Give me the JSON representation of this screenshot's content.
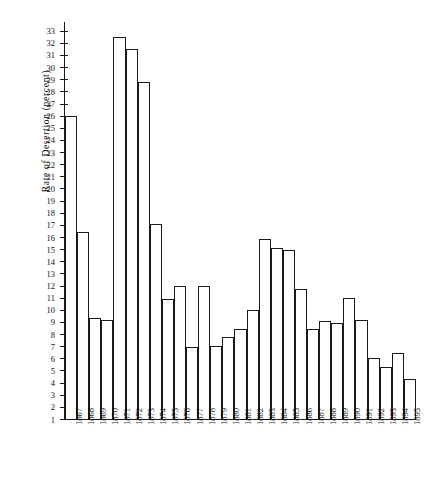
{
  "chart_data": {
    "type": "bar",
    "title": "",
    "xlabel": "",
    "ylabel": "Rate  of  Desertion  (percent)",
    "ylim": [
      1,
      33.8
    ],
    "baseline": 1,
    "grid": false,
    "legend": null,
    "ytick_labels": [
      "1",
      "2",
      "3",
      "4",
      "5",
      "6",
      "7",
      "8",
      "9",
      "10",
      "11",
      "12",
      "13",
      "14",
      "15",
      "16",
      "17",
      "18",
      "19",
      "20",
      "21",
      "22",
      "23",
      "24",
      "25",
      "26",
      "27",
      "28",
      "29",
      "30",
      "31",
      "32",
      "33"
    ],
    "categories": [
      "1867",
      "1868",
      "1869",
      "1870",
      "1871",
      "1872",
      "1873",
      "1874",
      "1875",
      "1876",
      "1877",
      "1878",
      "1879",
      "1880",
      "1881",
      "1882",
      "1883",
      "1884",
      "1885",
      "1886",
      "1887",
      "1888",
      "1889",
      "1890",
      "1891",
      "1892",
      "1893",
      "1894",
      "1895"
    ],
    "values": [
      26.0,
      16.4,
      9.3,
      9.2,
      32.5,
      31.5,
      28.8,
      17.1,
      10.9,
      12.0,
      6.9,
      12.0,
      7.0,
      7.8,
      8.4,
      10.0,
      15.8,
      15.1,
      14.9,
      11.7,
      8.4,
      9.1,
      8.9,
      11.0,
      9.2,
      6.0,
      5.3,
      6.4,
      4.3
    ]
  }
}
